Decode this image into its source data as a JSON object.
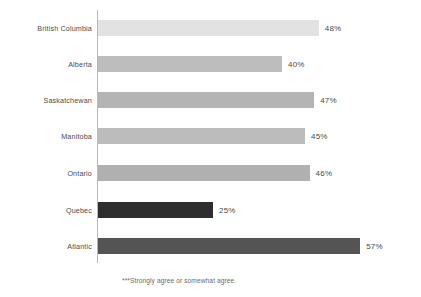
{
  "chart_data": {
    "type": "bar",
    "orientation": "horizontal",
    "title": "",
    "subtitle": "",
    "xlabel": "",
    "ylabel": "",
    "xlim": [
      0,
      70
    ],
    "grid": false,
    "legend": null,
    "categories": [
      "British Columbia",
      "Alberta",
      "Saskatchewan",
      "Manitoba",
      "Ontario",
      "Quebec",
      "Atlantic"
    ],
    "values": [
      48,
      40,
      47,
      45,
      46,
      25,
      57
    ],
    "value_labels": [
      "48%",
      "40%",
      "47%",
      "45%",
      "46%",
      "25%",
      "57%"
    ],
    "bar_colors": [
      "#e2e2e2",
      "#bdbdbd",
      "#b4b4b4",
      "#bcbcbc",
      "#b0b0b0",
      "#2e2e2e",
      "#545454"
    ],
    "annotations": [
      "***Strongly agree or somewhat agree."
    ]
  },
  "footnote": "***Strongly agree or somewhat agree.",
  "axis": {
    "line_color": "#b9b9b9"
  }
}
